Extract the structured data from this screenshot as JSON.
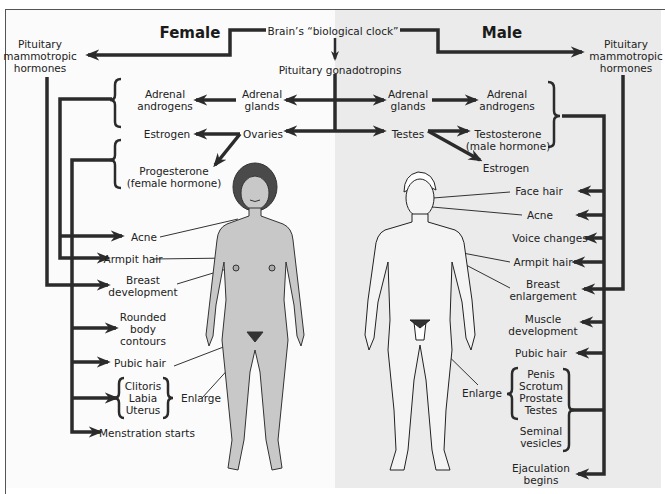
{
  "titles": {
    "female": "Female",
    "male": "Male"
  },
  "top": {
    "brain": "Brain’s “biological clock”",
    "gonadotropins": "Pituitary gonadotropins"
  },
  "female": {
    "mammotropic": [
      "Pituitary",
      "mammotropic",
      "hormones"
    ],
    "adrenal_glands": [
      "Adrenal",
      "glands"
    ],
    "adrenal_androgens": [
      "Adrenal",
      "androgens"
    ],
    "ovaries": "Ovaries",
    "estrogen": "Estrogen",
    "progesterone": [
      "Progesterone",
      "(female hormone)"
    ],
    "effects": {
      "acne": "Acne",
      "armpit_hair": "Armpit hair",
      "breast": [
        "Breast",
        "development"
      ],
      "rounded": [
        "Rounded",
        "body",
        "contours"
      ],
      "pubic_hair": "Pubic hair",
      "organs": [
        "Clitoris",
        "Labia",
        "Uterus"
      ],
      "enlarge": "Enlarge",
      "menstruation": "Menstration starts"
    }
  },
  "male": {
    "mammotropic": [
      "Pituitary",
      "mammotropic",
      "hormones"
    ],
    "adrenal_glands": [
      "Adrenal",
      "glands"
    ],
    "adrenal_androgens": [
      "Adrenal",
      "androgens"
    ],
    "testes": "Testes",
    "testosterone": [
      "Testosterone",
      "(male hormone)"
    ],
    "estrogen": "Estrogen",
    "effects": {
      "face_hair": "Face hair",
      "acne": "Acne",
      "voice": "Voice changes",
      "armpit_hair": "Armpit hair",
      "breast": [
        "Breast",
        "enlargement"
      ],
      "muscle": [
        "Muscle",
        "development"
      ],
      "pubic_hair": "Pubic hair",
      "organs": [
        "Penis",
        "Scrotum",
        "Prostate",
        "Testes"
      ],
      "seminal": [
        "Seminal",
        "vesicles"
      ],
      "enlarge": "Enlarge",
      "ejaculation": [
        "Ejaculation",
        "begins"
      ]
    }
  },
  "colors": {
    "line": "#2b2b2b",
    "skin_female": "#c8c8c8",
    "skin_male": "#f4f4f4",
    "hair": "#4a4a4a",
    "bg_left": "#fbfbfb",
    "bg_right": "#ebebeb"
  }
}
